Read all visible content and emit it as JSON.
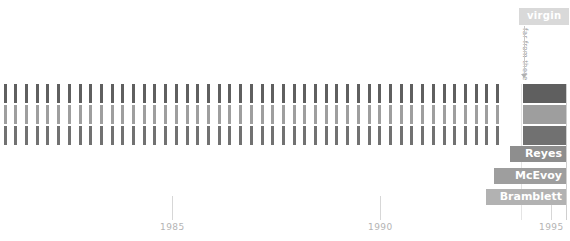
{
  "chart_data": {
    "type": "bar",
    "title": "",
    "subtitle": "",
    "xlabel": "",
    "ylabel": "",
    "grid": true,
    "legend_position": "right",
    "x_axis": {
      "ticks": [
        1985,
        1990,
        1995
      ],
      "tick_labels": [
        "1985",
        "1990",
        "1995"
      ],
      "range": [
        1980.4,
        1995.0
      ]
    },
    "series": [
      {
        "name": "Reyes",
        "color": "#5f5f5f",
        "row_index": 0,
        "x": [
          1980.5,
          1980.8,
          1981.1,
          1981.4,
          1981.7,
          1982.0,
          1982.3,
          1982.6,
          1982.9,
          1983.2,
          1983.5,
          1983.8,
          1984.1,
          1984.4,
          1984.7,
          1985.0,
          1985.3,
          1985.6,
          1985.9,
          1986.2,
          1986.5,
          1986.8,
          1987.1,
          1987.4,
          1987.7,
          1988.0,
          1988.3,
          1988.6,
          1988.9,
          1989.2,
          1989.5,
          1989.8,
          1990.1,
          1990.4,
          1990.7,
          1991.0,
          1991.3,
          1991.6,
          1991.9,
          1992.2,
          1992.5,
          1992.8,
          1993.1,
          1993.4,
          1993.7,
          1994.0,
          1994.3
        ]
      },
      {
        "name": "McEvoy",
        "color": "#9e9e9e",
        "row_index": 1,
        "x": [
          1980.5,
          1980.8,
          1981.1,
          1981.4,
          1981.7,
          1982.0,
          1982.3,
          1982.6,
          1982.9,
          1983.2,
          1983.5,
          1983.8,
          1984.1,
          1984.4,
          1984.7,
          1985.0,
          1985.3,
          1985.6,
          1985.9,
          1986.2,
          1986.5,
          1986.8,
          1987.1,
          1987.4,
          1987.7,
          1988.0,
          1988.3,
          1988.6,
          1988.9,
          1989.2,
          1989.5,
          1989.8,
          1990.1,
          1990.4,
          1990.7,
          1991.0,
          1991.3,
          1991.6,
          1991.9,
          1992.2,
          1992.5,
          1992.8,
          1993.1,
          1993.4,
          1993.7,
          1994.0,
          1994.3
        ]
      },
      {
        "name": "Bramblett",
        "color": "#717171",
        "row_index": 2,
        "x": [
          1980.5,
          1980.8,
          1981.1,
          1981.4,
          1981.7,
          1982.0,
          1982.3,
          1982.6,
          1982.9,
          1983.2,
          1983.5,
          1983.8,
          1984.1,
          1984.4,
          1984.7,
          1985.0,
          1985.3,
          1985.6,
          1985.9,
          1986.2,
          1986.5,
          1986.8,
          1987.1,
          1987.4,
          1987.7,
          1988.0,
          1988.3,
          1988.6,
          1988.9,
          1989.2,
          1989.5,
          1989.8,
          1990.1,
          1990.4,
          1990.7,
          1991.0,
          1991.3,
          1991.6,
          1991.9,
          1992.2,
          1992.5,
          1992.8,
          1993.1,
          1993.4,
          1993.7,
          1994.0,
          1994.3
        ]
      }
    ],
    "annotations": [
      {
        "label": "virgin",
        "vertical_text": "far from these",
        "points_to_series": "Reyes",
        "points_to_x": 1994.6
      }
    ]
  },
  "annotation": {
    "badge_label": "virgin",
    "badge_color": "#d9d9d9",
    "vertical_text": "far from these",
    "vertical_text_color": "#9a9a9a"
  },
  "legend": {
    "entries": [
      {
        "label": "Reyes",
        "color": "#5f5f5f",
        "label_bg": "#8e8e8e"
      },
      {
        "label": "McEvoy",
        "color": "#9e9e9e",
        "label_bg": "#9e9e9e"
      },
      {
        "label": "Bramblett",
        "color": "#717171",
        "label_bg": "#b2b2b2"
      }
    ]
  },
  "axis": {
    "labels": [
      {
        "text": "1985"
      },
      {
        "text": "1990"
      },
      {
        "text": "1995"
      }
    ],
    "tick_color": "#d7d7d7",
    "label_color": "#b4b4b4"
  }
}
